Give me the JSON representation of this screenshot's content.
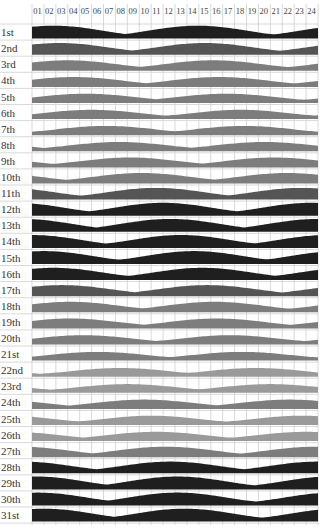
{
  "chart_data": {
    "type": "area",
    "title": "",
    "xlabel": "Hour of day",
    "ylabel": "Tide height (relative)",
    "x_tick_labels": [
      "01",
      "02",
      "03",
      "04",
      "05",
      "06",
      "07",
      "08",
      "09",
      "10",
      "11",
      "12",
      "13",
      "14",
      "15",
      "16",
      "17",
      "18",
      "19",
      "20",
      "21",
      "22",
      "23",
      "24"
    ],
    "xlim": [
      0,
      24
    ],
    "grid": true,
    "legend": "none",
    "shade_levels": {
      "dark": "#1f1f1f",
      "mid": "#555555",
      "light": "#7d7d7d",
      "pale": "#9a9a9a"
    },
    "days": [
      {
        "label": "1st",
        "peaks": [
          1.8,
          13.9
        ],
        "amp": 0.95,
        "shade": "dark"
      },
      {
        "label": "2nd",
        "peaks": [
          2.3,
          14.5
        ],
        "amp": 0.85,
        "shade": "mid"
      },
      {
        "label": "3rd",
        "peaks": [
          3.0,
          15.2
        ],
        "amp": 0.75,
        "shade": "light"
      },
      {
        "label": "4th",
        "peaks": [
          3.5,
          15.7
        ],
        "amp": 0.7,
        "shade": "light"
      },
      {
        "label": "5th",
        "peaks": [
          4.5,
          16.3
        ],
        "amp": 0.65,
        "shade": "light"
      },
      {
        "label": "6th",
        "peaks": [
          5.0,
          17.5
        ],
        "amp": 0.65,
        "shade": "light"
      },
      {
        "label": "7th",
        "peaks": [
          6.2,
          17.8
        ],
        "amp": 0.65,
        "shade": "light"
      },
      {
        "label": "8th",
        "peaks": [
          7.3,
          19.5
        ],
        "amp": 0.65,
        "shade": "light"
      },
      {
        "label": "9th",
        "peaks": [
          8.2,
          20.3
        ],
        "amp": 0.7,
        "shade": "light"
      },
      {
        "label": "10th",
        "peaks": [
          9.2,
          21.4
        ],
        "amp": 0.75,
        "shade": "light"
      },
      {
        "label": "11th",
        "peaks": [
          10.4,
          22.6
        ],
        "amp": 0.85,
        "shade": "mid"
      },
      {
        "label": "12th",
        "peaks": [
          11.0,
          23.4
        ],
        "amp": 0.95,
        "shade": "dark"
      },
      {
        "label": "13th",
        "peaks": [
          11.6,
          24.0
        ],
        "amp": 0.95,
        "shade": "dark"
      },
      {
        "label": "14th",
        "peaks": [
          0.0,
          12.5
        ],
        "amp": 0.95,
        "shade": "dark"
      },
      {
        "label": "15th",
        "peaks": [
          1.0,
          13.6
        ],
        "amp": 0.95,
        "shade": "dark"
      },
      {
        "label": "16th",
        "peaks": [
          1.8,
          14.3
        ],
        "amp": 0.9,
        "shade": "dark"
      },
      {
        "label": "17th",
        "peaks": [
          2.5,
          14.7
        ],
        "amp": 0.8,
        "shade": "mid"
      },
      {
        "label": "18th",
        "peaks": [
          3.2,
          15.3
        ],
        "amp": 0.75,
        "shade": "light"
      },
      {
        "label": "19th",
        "peaks": [
          3.2,
          15.5
        ],
        "amp": 0.7,
        "shade": "light"
      },
      {
        "label": "20th",
        "peaks": [
          4.3,
          16.6
        ],
        "amp": 0.65,
        "shade": "light"
      },
      {
        "label": "21st",
        "peaks": [
          5.5,
          17.6
        ],
        "amp": 0.6,
        "shade": "light"
      },
      {
        "label": "22nd",
        "peaks": [
          7.4,
          18.8
        ],
        "amp": 0.6,
        "shade": "pale"
      },
      {
        "label": "23rd",
        "peaks": [
          8.0,
          20.0
        ],
        "amp": 0.6,
        "shade": "pale"
      },
      {
        "label": "24th",
        "peaks": [
          9.4,
          21.6
        ],
        "amp": 0.65,
        "shade": "light"
      },
      {
        "label": "25th",
        "peaks": [
          10.0,
          22.6
        ],
        "amp": 0.65,
        "shade": "pale"
      },
      {
        "label": "26th",
        "peaks": [
          10.4,
          23.0
        ],
        "amp": 0.65,
        "shade": "pale"
      },
      {
        "label": "27th",
        "peaks": [
          11.2,
          23.8
        ],
        "amp": 0.75,
        "shade": "light"
      },
      {
        "label": "28th",
        "peaks": [
          11.6,
          24.0
        ],
        "amp": 0.85,
        "shade": "dark"
      },
      {
        "label": "29th",
        "peaks": [
          0.3,
          12.2
        ],
        "amp": 0.95,
        "shade": "dark"
      },
      {
        "label": "30th",
        "peaks": [
          0.5,
          12.2
        ],
        "amp": 0.95,
        "shade": "dark"
      },
      {
        "label": "31st",
        "peaks": [
          1.0,
          12.8
        ],
        "amp": 0.95,
        "shade": "dark"
      }
    ]
  },
  "layout": {
    "plot_left": 32,
    "plot_right": 318,
    "header_y": 14,
    "rows_top": 24,
    "row_height": 16.1,
    "hump_max_px": 12,
    "half_width_hours": 5.2
  }
}
